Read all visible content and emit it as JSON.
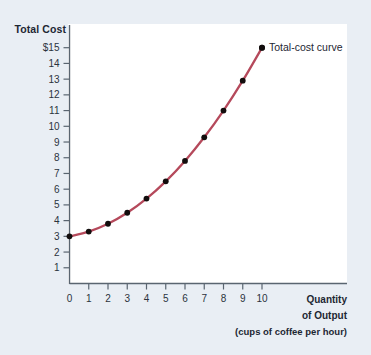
{
  "figure": {
    "background_color": "#e9eef4",
    "plot_background_color": "#ffffff",
    "axis_color": "#5a6570",
    "curve_color": "#b5495b",
    "marker_color": "#120d0d",
    "text_color": "#1d2733"
  },
  "labels": {
    "y_axis_title": "Total Cost",
    "x_axis_title_line1": "Quantity",
    "x_axis_title_line2": "of Output",
    "x_axis_title_line3": "(cups of coffee per hour)",
    "curve_annotation": "Total-cost curve"
  },
  "chart_data": {
    "type": "line",
    "title": "",
    "xlabel": "Quantity of Output (cups of coffee per hour)",
    "ylabel": "Total Cost",
    "xlim": [
      0,
      11.8
    ],
    "ylim": [
      0,
      15.6
    ],
    "grid": false,
    "legend": "none",
    "annotations": [
      {
        "text": "Total-cost curve",
        "x": 10,
        "y": 15,
        "position": "right-of-point"
      }
    ],
    "xticks": [
      0,
      1,
      2,
      3,
      4,
      5,
      6,
      7,
      8,
      9,
      10
    ],
    "xticklabels": [
      "0",
      "1",
      "2",
      "3",
      "4",
      "5",
      "6",
      "7",
      "8",
      "9",
      "10"
    ],
    "yticks": [
      1,
      2,
      3,
      4,
      5,
      6,
      7,
      8,
      9,
      10,
      11,
      12,
      13,
      14,
      15
    ],
    "yticklabels": [
      "1",
      "2",
      "3",
      "4",
      "5",
      "6",
      "7",
      "8",
      "9",
      "10",
      "11",
      "12",
      "13",
      "14",
      "$15"
    ],
    "series": [
      {
        "name": "Total-cost curve",
        "marker": "filled-circle",
        "x": [
          0,
          1,
          2,
          3,
          4,
          5,
          6,
          7,
          8,
          9,
          10
        ],
        "values": [
          3.0,
          3.3,
          3.8,
          4.5,
          5.4,
          6.5,
          7.8,
          9.3,
          11.0,
          12.9,
          15.0
        ]
      }
    ]
  }
}
